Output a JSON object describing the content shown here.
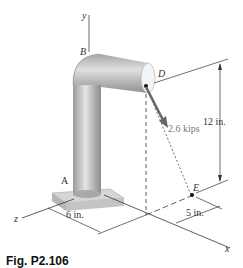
{
  "figure": {
    "caption": "Fig. P2.106",
    "points": {
      "y_axis": "y",
      "z_axis": "z",
      "x_axis": "x",
      "A": "A",
      "B": "B",
      "D": "D",
      "E": "E"
    },
    "force_label": "2.6 kips",
    "dimensions": {
      "height": "12 in.",
      "z_offset": "6 in.",
      "x_offset": "5 in."
    }
  }
}
